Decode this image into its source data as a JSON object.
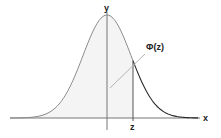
{
  "diagram": {
    "axes": {
      "x_label": "x",
      "y_label": "y"
    },
    "marker": {
      "label": "z"
    },
    "annotation": {
      "label": "Φ(z)"
    },
    "colors": {
      "axis": "#777777",
      "curve_left": "#8a8a8a",
      "curve_right": "#2a2a2a",
      "shade": "#f4f4f4",
      "leader": "#b5b5b5",
      "text": "#222222"
    }
  }
}
